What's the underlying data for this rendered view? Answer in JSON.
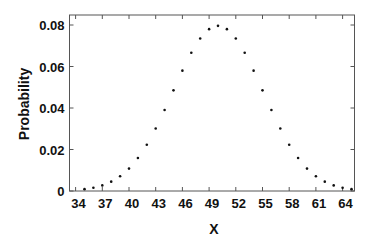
{
  "chart_data": {
    "type": "scatter",
    "title": "",
    "xlabel": "X",
    "ylabel": "Probability",
    "xlim": [
      33.3,
      65.6
    ],
    "ylim": [
      0,
      0.084
    ],
    "x_ticks": [
      34,
      37,
      40,
      43,
      46,
      49,
      52,
      55,
      58,
      61,
      64
    ],
    "y_ticks": [
      0,
      0.02,
      0.04,
      0.06,
      0.08
    ],
    "y_tick_labels": [
      "0",
      "0.02",
      "0.04",
      "0.06",
      "0.08"
    ],
    "grid": false,
    "legend": null,
    "series": [
      {
        "name": "P(X)",
        "marker": "dot",
        "color": "#111111",
        "x": [
          35,
          36,
          37,
          38,
          39,
          40,
          41,
          42,
          43,
          44,
          45,
          46,
          47,
          48,
          49,
          50,
          51,
          52,
          53,
          54,
          55,
          56,
          57,
          58,
          59,
          60,
          61,
          62,
          63,
          64,
          65
        ],
        "y": [
          0.0009,
          0.0016,
          0.0027,
          0.0045,
          0.0071,
          0.0108,
          0.0159,
          0.0223,
          0.0301,
          0.039,
          0.0485,
          0.058,
          0.0666,
          0.0735,
          0.078,
          0.0796,
          0.078,
          0.0735,
          0.0666,
          0.058,
          0.0485,
          0.039,
          0.0301,
          0.0223,
          0.0159,
          0.0108,
          0.0071,
          0.0045,
          0.0027,
          0.0016,
          0.0009
        ]
      }
    ]
  }
}
